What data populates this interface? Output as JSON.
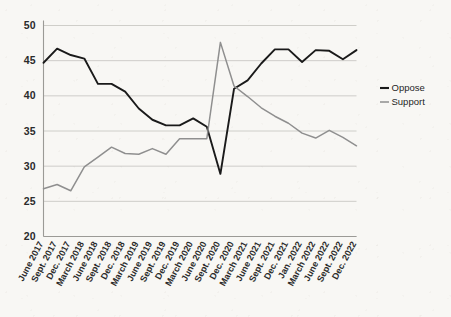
{
  "chart_data": {
    "type": "line",
    "title": "",
    "subtitle": "",
    "xlabel": "",
    "ylabel": "",
    "ylim": [
      20,
      50
    ],
    "yticks": [
      20,
      25,
      30,
      35,
      40,
      45,
      50
    ],
    "grid": true,
    "legend_position": "right",
    "categories": [
      "June 2017",
      "Sept. 2017",
      "Dec. 2017",
      "March 2018",
      "June 2018",
      "Sept. 2018",
      "Dec. 2018",
      "March 2019",
      "June 2019",
      "Sept. 2019",
      "Dec. 2019",
      "March 2020",
      "June 2020",
      "Sept. 2020",
      "Dec. 2020",
      "March 2021",
      "June 2021",
      "Sept. 2021",
      "Dec. 2021",
      "Jan. 2022",
      "March 2022",
      "June 2022",
      "Sept. 2022",
      "Dec. 2022"
    ],
    "series": [
      {
        "name": "Oppose",
        "color": "#1a1a1a",
        "values": [
          44.7,
          46.7,
          45.8,
          45.3,
          41.7,
          41.7,
          40.6,
          38.2,
          36.6,
          35.8,
          35.8,
          36.8,
          35.6,
          28.9,
          41.0,
          42.2,
          44.6,
          46.6,
          46.6,
          44.8,
          46.5,
          46.4,
          45.2,
          46.5
        ]
      },
      {
        "name": "Support",
        "color": "#8f8f8f",
        "values": [
          26.8,
          27.4,
          26.5,
          29.9,
          31.3,
          32.7,
          31.8,
          31.7,
          32.5,
          31.7,
          33.9,
          33.9,
          33.9,
          47.6,
          41.4,
          39.9,
          38.3,
          37.1,
          36.1,
          34.7,
          34.0,
          35.1,
          34.1,
          32.9
        ]
      }
    ]
  },
  "legend": {
    "items": [
      {
        "label": "Oppose",
        "color": "#1a1a1a"
      },
      {
        "label": "Support",
        "color": "#8f8f8f"
      }
    ]
  },
  "axis": {
    "y_labels": [
      "50",
      "45",
      "40",
      "35",
      "30",
      "25",
      "20"
    ],
    "x_labels": [
      "June 2017",
      "Sept. 2017",
      "Dec. 2017",
      "March 2018",
      "June 2018",
      "Sept. 2018",
      "Dec. 2018",
      "March 2019",
      "June 2019",
      "Sept. 2019",
      "Dec. 2019",
      "March 2020",
      "June 2020",
      "Sept. 2020",
      "Dec. 2020",
      "March 2021",
      "June 2021",
      "Sept. 2021",
      "Dec. 2021",
      "Jan. 2022",
      "March 2022",
      "June 2022",
      "Sept. 2022",
      "Dec. 2022"
    ]
  }
}
